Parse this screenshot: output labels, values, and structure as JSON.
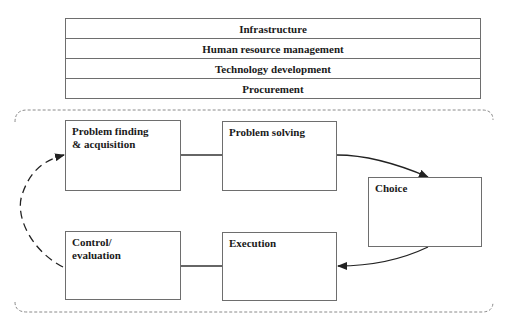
{
  "support_activities": [
    {
      "label": "Infrastructure"
    },
    {
      "label": "Human resource management"
    },
    {
      "label": "Technology development"
    },
    {
      "label": "Procurement"
    }
  ],
  "process": {
    "nodes": [
      {
        "id": "problem-finding",
        "label": "Problem finding & acquisition"
      },
      {
        "id": "problem-solving",
        "label": "Problem solving"
      },
      {
        "id": "choice",
        "label": "Choice"
      },
      {
        "id": "execution",
        "label": "Execution"
      },
      {
        "id": "control-evaluation",
        "label": "Control/ evaluation"
      }
    ],
    "edges": [
      {
        "from": "problem-finding",
        "to": "problem-solving",
        "style": "solid-line"
      },
      {
        "from": "problem-solving",
        "to": "choice",
        "style": "solid-arrow"
      },
      {
        "from": "choice",
        "to": "execution",
        "style": "solid-arrow"
      },
      {
        "from": "execution",
        "to": "control-evaluation",
        "style": "solid-line"
      },
      {
        "from": "control-evaluation",
        "to": "problem-finding",
        "style": "dashed-arrow"
      }
    ]
  },
  "colors": {
    "stroke": "#6e6e6e",
    "arrow": "#222222",
    "text": "#1a1a1a"
  }
}
